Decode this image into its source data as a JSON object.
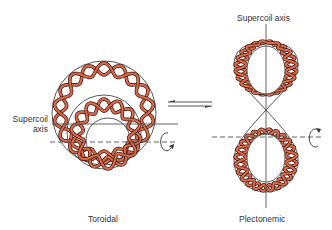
{
  "diagram": {
    "labels": {
      "supercoil_axis_left_line1": "Supercoil",
      "supercoil_axis_left_line2": "axis",
      "supercoil_axis_right": "Supercoil axis",
      "toroidal": "Toroidal",
      "plectonemic": "Plectonemic"
    },
    "equilibrium_arrows": "reversible",
    "colors": {
      "strand_fill": "#d9694a",
      "strand_outline": "#3a1a12",
      "outline": "#444444",
      "axis_line": "#555555",
      "label_text": "#333333"
    },
    "icons": [
      "equilibrium-arrows-icon",
      "rotation-arrow-icon"
    ]
  }
}
